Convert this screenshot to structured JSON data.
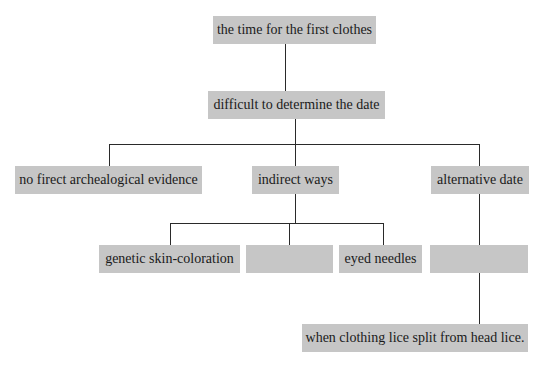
{
  "diagram": {
    "type": "tree",
    "colors": {
      "node_fill": "#c6c6c6",
      "line": "#2a2a2a",
      "background": "#ffffff"
    },
    "root": {
      "label": "the time for the first clothes"
    },
    "level1": {
      "label": "difficult to determine the date"
    },
    "level2": [
      {
        "label": "no firect archealogical evidence"
      },
      {
        "label": "indirect ways"
      },
      {
        "label": "alternative date"
      }
    ],
    "level3": [
      {
        "label": "genetic skin-coloration"
      },
      {
        "label": ""
      },
      {
        "label": "eyed needles"
      },
      {
        "label": ""
      }
    ],
    "level4": {
      "label": "when clothing lice split from head lice."
    }
  }
}
